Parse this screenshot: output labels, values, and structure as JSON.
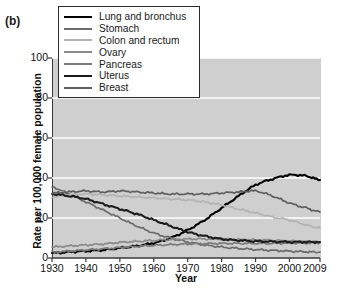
{
  "panel": {
    "label": "(b)"
  },
  "legend": {
    "position": "top-left-inside",
    "entries": [
      {
        "label": "Lung and bronchus",
        "color": "#000000"
      },
      {
        "label": "Stomach",
        "color": "#6b6b6b"
      },
      {
        "label": "Colon and rectum",
        "color": "#b3b3b3"
      },
      {
        "label": "Ovary",
        "color": "#8a8a8a"
      },
      {
        "label": "Pancreas",
        "color": "#7a7a7a"
      },
      {
        "label": "Uterus",
        "color": "#1c1c1c"
      },
      {
        "label": "Breast",
        "color": "#5e5e5e"
      }
    ]
  },
  "chart_data": {
    "type": "line",
    "title": "",
    "subtitle": "",
    "xlabel": "Year",
    "ylabel": "Rate per 100,000 female population",
    "xlim": [
      1930,
      2009
    ],
    "ylim": [
      0,
      100
    ],
    "xticks": [
      1930,
      1940,
      1950,
      1960,
      1970,
      1980,
      1990,
      2000,
      2009
    ],
    "yticks": [
      0,
      20,
      40,
      60,
      80,
      100
    ],
    "grid": "horizontal-white",
    "plot_background": "#cfcfcf",
    "x": [
      1930,
      1935,
      1940,
      1945,
      1950,
      1955,
      1960,
      1965,
      1970,
      1975,
      1980,
      1985,
      1990,
      1995,
      2000,
      2005,
      2009
    ],
    "series": [
      {
        "name": "Lung and bronchus",
        "color": "#000000",
        "values": [
          2.5,
          3.0,
          3.5,
          4.0,
          5.0,
          6.0,
          7.5,
          10.0,
          14.0,
          19.0,
          25.0,
          31.0,
          36.5,
          39.5,
          41.5,
          41.0,
          39.0
        ]
      },
      {
        "name": "Stomach",
        "color": "#6b6b6b",
        "values": [
          35.5,
          32.0,
          28.0,
          24.0,
          20.0,
          16.0,
          12.5,
          10.0,
          8.0,
          6.5,
          5.5,
          4.8,
          4.2,
          3.8,
          3.4,
          3.1,
          2.9
        ]
      },
      {
        "name": "Colon and rectum",
        "color": "#b3b3b3",
        "values": [
          30.5,
          31.5,
          32.0,
          31.5,
          31.0,
          30.5,
          30.0,
          29.5,
          29.0,
          28.0,
          26.5,
          24.5,
          22.5,
          20.5,
          19.0,
          16.5,
          15.0
        ]
      },
      {
        "name": "Ovary",
        "color": "#8a8a8a",
        "values": [
          5.5,
          6.0,
          6.5,
          7.0,
          7.8,
          8.3,
          8.8,
          9.2,
          9.5,
          9.5,
          9.4,
          9.2,
          9.0,
          8.8,
          8.5,
          8.2,
          8.0
        ]
      },
      {
        "name": "Pancreas",
        "color": "#7a7a7a",
        "values": [
          3.0,
          3.4,
          4.0,
          4.6,
          5.2,
          5.8,
          6.3,
          6.7,
          7.0,
          7.2,
          7.3,
          7.3,
          7.3,
          7.3,
          7.4,
          7.5,
          7.6
        ]
      },
      {
        "name": "Uterus",
        "color": "#1c1c1c",
        "values": [
          32.0,
          31.0,
          29.5,
          27.0,
          24.5,
          22.0,
          19.0,
          16.0,
          13.0,
          11.0,
          9.5,
          8.8,
          8.4,
          8.2,
          8.0,
          8.0,
          8.0
        ]
      },
      {
        "name": "Breast",
        "color": "#5e5e5e",
        "values": [
          32.5,
          33.0,
          33.5,
          33.0,
          33.5,
          33.0,
          32.5,
          32.0,
          32.0,
          32.0,
          32.5,
          33.0,
          33.5,
          31.0,
          27.5,
          25.0,
          23.0
        ]
      }
    ]
  }
}
